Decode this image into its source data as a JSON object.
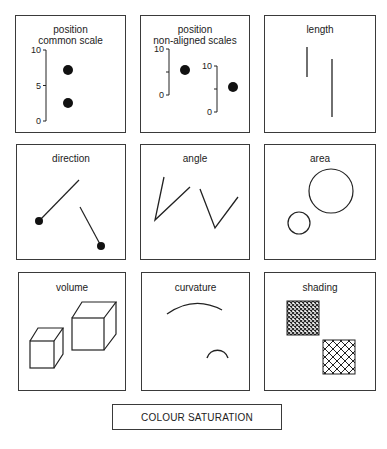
{
  "panels": {
    "position_common": {
      "title_line1": "position",
      "title_line2": "common scale",
      "ticks": [
        "10",
        "5",
        "0"
      ],
      "values": [
        7,
        3
      ]
    },
    "position_nonaligned": {
      "title_line1": "position",
      "title_line2": "non-aligned scales",
      "scale1_ticks": [
        "10",
        "0"
      ],
      "scale2_ticks": [
        "10",
        "0"
      ],
      "values": [
        6,
        4
      ]
    },
    "length": {
      "title": "length"
    },
    "direction": {
      "title": "direction"
    },
    "angle": {
      "title": "angle"
    },
    "area": {
      "title": "area"
    },
    "volume": {
      "title": "volume"
    },
    "curvature": {
      "title": "curvature"
    },
    "shading": {
      "title": "shading"
    }
  },
  "footer": {
    "label": "COLOUR SATURATION"
  },
  "colors": {
    "ink": "#222222",
    "border": "#3a3a3a",
    "background": "#ffffff"
  }
}
